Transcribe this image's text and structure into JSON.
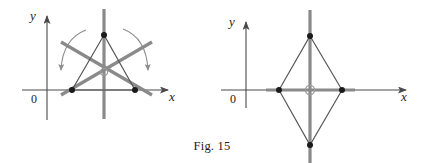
{
  "figure": {
    "caption": "Fig. 15",
    "background_color": "#ffffff",
    "ink_color": "#2a2a2a",
    "axis_color": "#4a4a4a",
    "symmetry_line_color": "#8a8a8a",
    "shape_outline_color": "#555555",
    "vertex_dot_color": "#1a1a1a",
    "arrow_color": "#888888",
    "center_marker_color": "#9a9a9a"
  },
  "panels": [
    {
      "id": "left-panel",
      "name": "equilateral-triangle-symmetry",
      "axes": {
        "y_label": "y",
        "x_label": "x",
        "origin_label": "0",
        "origin_px": {
          "x": 47,
          "y": 90
        }
      },
      "shape": {
        "type": "triangle",
        "vertices_px": [
          {
            "x": 104,
            "y": 35
          },
          {
            "x": 72,
            "y": 90
          },
          {
            "x": 135,
            "y": 90
          }
        ],
        "vertex_marker": "filled-dot",
        "vertex_marker_radius": 3
      },
      "symmetry": {
        "axes_count": 3,
        "center_marker": "open-circle",
        "center_px": {
          "x": 104,
          "y": 72
        },
        "lines_px": [
          {
            "x1": 104,
            "y1": 9,
            "x2": 104,
            "y2": 119
          },
          {
            "x1": 61,
            "y1": 42,
            "x2": 152,
            "y2": 95
          },
          {
            "x1": 152,
            "y1": 42,
            "x2": 61,
            "y2": 95
          }
        ]
      },
      "rotation_arrows": [
        {
          "side": "left",
          "direction": "down"
        },
        {
          "side": "right",
          "direction": "down"
        }
      ]
    },
    {
      "id": "right-panel",
      "name": "rhombus-symmetry",
      "axes": {
        "y_label": "y",
        "x_label": "x",
        "origin_label": "0",
        "origin_px": {
          "x": 246,
          "y": 90
        }
      },
      "shape": {
        "type": "rhombus",
        "vertices_px": [
          {
            "x": 310,
            "y": 36
          },
          {
            "x": 342,
            "y": 90
          },
          {
            "x": 310,
            "y": 145
          },
          {
            "x": 279,
            "y": 90
          }
        ],
        "vertex_marker": "filled-dot",
        "vertex_marker_radius": 3
      },
      "symmetry": {
        "axes_count": 2,
        "center_marker": "open-circle",
        "center_px": {
          "x": 310,
          "y": 90
        },
        "lines_px": [
          {
            "x1": 310,
            "y1": 10,
            "x2": 310,
            "y2": 163
          },
          {
            "x1": 266,
            "y1": 90,
            "x2": 355,
            "y2": 90
          }
        ]
      },
      "rotation_arrows": []
    }
  ]
}
